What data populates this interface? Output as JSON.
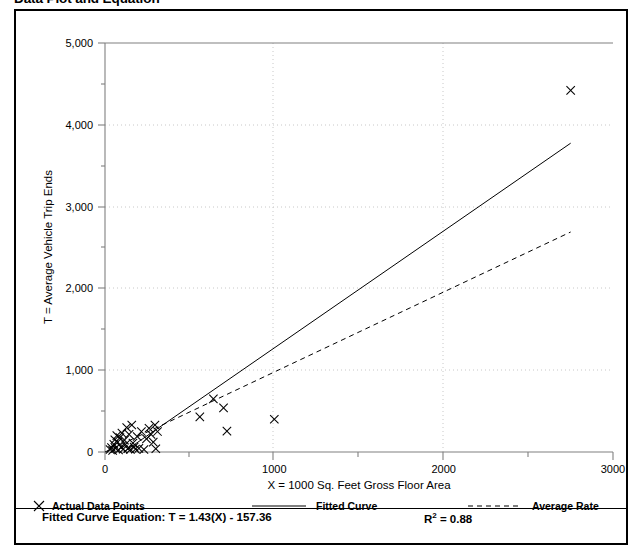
{
  "title": "Data Plot and Equation",
  "chart_data": {
    "type": "scatter",
    "title": "Data Plot and Equation",
    "xlabel": "X = 1000 Sq. Feet Gross Floor Area",
    "ylabel": "T = Average Vehicle Trip Ends",
    "xlim": [
      0,
      3000
    ],
    "ylim": [
      0,
      5000
    ],
    "xticks": [
      0,
      1000,
      2000,
      3000
    ],
    "xticklabels": [
      "0",
      "1000",
      "2000",
      "3000"
    ],
    "xminorticks": [
      500,
      1500,
      2500
    ],
    "yticks": [
      0,
      1000,
      2000,
      3000,
      4000,
      5000
    ],
    "yticklabels": [
      "0",
      "1,000",
      "2,000",
      "3,000",
      "4,000",
      "5,000"
    ],
    "yminorticks": [
      500,
      1500,
      2500,
      3500,
      4500
    ],
    "grid": "dotted-major-both",
    "legend_position": "bottom",
    "series": [
      {
        "name": "Actual Data Points",
        "type": "scatter",
        "marker": "x",
        "color": "#000000",
        "points": [
          [
            30,
            30
          ],
          [
            38,
            55
          ],
          [
            45,
            20
          ],
          [
            52,
            95
          ],
          [
            58,
            150
          ],
          [
            62,
            45
          ],
          [
            70,
            200
          ],
          [
            75,
            120
          ],
          [
            80,
            25
          ],
          [
            88,
            175
          ],
          [
            95,
            60
          ],
          [
            100,
            230
          ],
          [
            108,
            35
          ],
          [
            115,
            145
          ],
          [
            120,
            90
          ],
          [
            128,
            300
          ],
          [
            135,
            40
          ],
          [
            142,
            215
          ],
          [
            150,
            30
          ],
          [
            158,
            330
          ],
          [
            165,
            110
          ],
          [
            172,
            60
          ],
          [
            180,
            35
          ],
          [
            190,
            190
          ],
          [
            200,
            45
          ],
          [
            215,
            250
          ],
          [
            230,
            30
          ],
          [
            245,
            160
          ],
          [
            260,
            290
          ],
          [
            272,
            215
          ],
          [
            285,
            120
          ],
          [
            295,
            330
          ],
          [
            300,
            40
          ],
          [
            310,
            250
          ],
          [
            560,
            430
          ],
          [
            640,
            650
          ],
          [
            700,
            540
          ],
          [
            720,
            255
          ],
          [
            1000,
            400
          ],
          [
            2750,
            4420
          ]
        ]
      },
      {
        "name": "Fitted Curve",
        "type": "line",
        "style": "solid",
        "color": "#000000",
        "equation": "T = 1.43(X) - 157.36",
        "slope": 1.43,
        "intercept": -157.36,
        "r_squared": 0.88,
        "x_range": [
          110,
          2750
        ]
      },
      {
        "name": "Average Rate",
        "type": "line",
        "style": "dashed",
        "color": "#000000",
        "slope": 0.978,
        "intercept": 0,
        "x_range": [
          0,
          2750
        ]
      }
    ]
  },
  "legend": {
    "items": [
      {
        "label": "Actual Data Points",
        "marker": "x-marker"
      },
      {
        "label": "Fitted Curve",
        "marker": "solid-line"
      },
      {
        "label": "Average Rate",
        "marker": "dashed-line"
      }
    ]
  },
  "footer": {
    "equation_label": "Fitted Curve Equation:",
    "equation_value": "T = 1.43(X) - 157.36",
    "equation_full": "Fitted Curve Equation:  T = 1.43(X) - 157.36",
    "r_label": "R",
    "r_exponent": "2",
    "r_value": " = 0.88"
  },
  "colors": {
    "frame": "#000000",
    "axis": "#808080",
    "grid": "#bfbfbf",
    "data": "#000000",
    "background": "#ffffff"
  }
}
